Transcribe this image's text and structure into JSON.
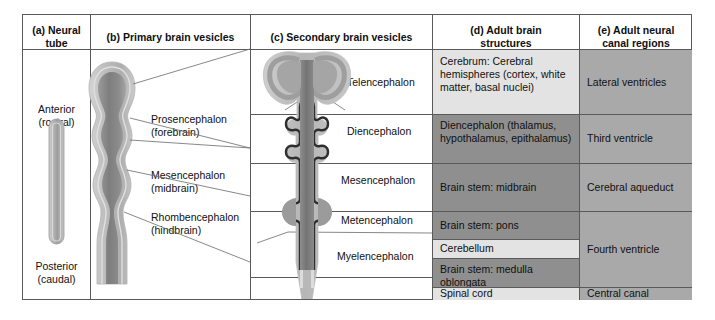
{
  "figure": {
    "columns": [
      {
        "key": "a",
        "label": "(a)  Neural\ntube",
        "line1": "(a)  Neural",
        "line2": "tube"
      },
      {
        "key": "b",
        "label": "(b)  Primary brain vesicles",
        "line1": "(b)  Primary brain vesicles",
        "line2": ""
      },
      {
        "key": "c",
        "label": "(c)  Secondary brain vesicles",
        "line1": "(c)  Secondary brain vesicles",
        "line2": ""
      },
      {
        "key": "d",
        "label": "(d)  Adult brain structures",
        "line1": "(d)  Adult brain",
        "line2": "structures"
      },
      {
        "key": "e",
        "label": "(e)  Adult neural canal regions",
        "line1": "(e)  Adult neural",
        "line2": "canal regions"
      }
    ],
    "neural_tube": {
      "top_label_line1": "Anterior",
      "top_label_line2": "(rostral)",
      "bottom_label_line1": "Posterior",
      "bottom_label_line2": "(caudal)"
    },
    "primary_vesicles": [
      {
        "line1": "Prosencephalon",
        "line2": "(forebrain)"
      },
      {
        "line1": "Mesencephalon",
        "line2": "(midbrain)"
      },
      {
        "line1": "Rhombencephalon",
        "line2": "(hindbrain)"
      }
    ],
    "secondary_vesicles": [
      {
        "name": "Telencephalon"
      },
      {
        "name": "Diencephalon"
      },
      {
        "name": "Mesencephalon"
      },
      {
        "name": "Metencephalon"
      },
      {
        "name": "Myelencephalon"
      }
    ],
    "adult_brain_structures": [
      {
        "text": "Cerebrum: Cerebral hemispheres (cortex, white matter, basal nuclei)",
        "shade": "light"
      },
      {
        "text": "Diencephalon (thalamus, hypothalamus, epithalamus)",
        "shade": "dark"
      },
      {
        "text": "Brain stem: midbrain",
        "shade": "dark"
      },
      {
        "text": "Brain stem: pons",
        "shade": "dark"
      },
      {
        "text": "Cerebellum",
        "shade": "light"
      },
      {
        "text": "Brain stem: medulla oblongata",
        "shade": "dark"
      },
      {
        "text": "Spinal cord",
        "shade": "light"
      }
    ],
    "adult_neural_canal_regions": [
      {
        "text": "Lateral ventricles",
        "shade": "med"
      },
      {
        "text": "Third ventricle",
        "shade": "med"
      },
      {
        "text": "Cerebral aqueduct",
        "shade": "med"
      },
      {
        "text": "Fourth ventricle",
        "shade": "med"
      },
      {
        "text": "Central canal",
        "shade": "med"
      }
    ],
    "colors": {
      "border": "#5a5a5a",
      "shade_light": "#e3e3e3",
      "shade_medium": "#a9a9a9",
      "shade_dark": "#8f8f8f",
      "tissue_outer": "#c9c9c9",
      "tissue_mid": "#a0a0a0",
      "tissue_inner": "#6e6e6e",
      "tissue_outline": "#2b2b2b",
      "background": "#ffffff"
    }
  }
}
